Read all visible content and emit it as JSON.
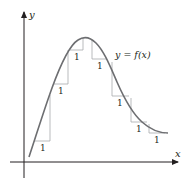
{
  "figure": {
    "axes": {
      "x_label": "x",
      "y_label": "y"
    },
    "function_label": "y = f(x)",
    "curve_description": "smooth hump: rises from near the origin to a single maximum, then decreases and levels off",
    "step_run_label": "1",
    "steps": [
      {
        "label": "1",
        "direction": "rise"
      },
      {
        "label": "1",
        "direction": "rise"
      },
      {
        "label": "1",
        "direction": "rise"
      },
      {
        "label": "1",
        "direction": "fall"
      },
      {
        "label": "1",
        "direction": "fall"
      },
      {
        "label": "1",
        "direction": "fall"
      },
      {
        "label": "1",
        "direction": "fall"
      }
    ],
    "colors": {
      "axis": "#231f20",
      "curve": "#6d6e71",
      "step_lines": "#a7a9ac",
      "background": "#ffffff"
    }
  }
}
